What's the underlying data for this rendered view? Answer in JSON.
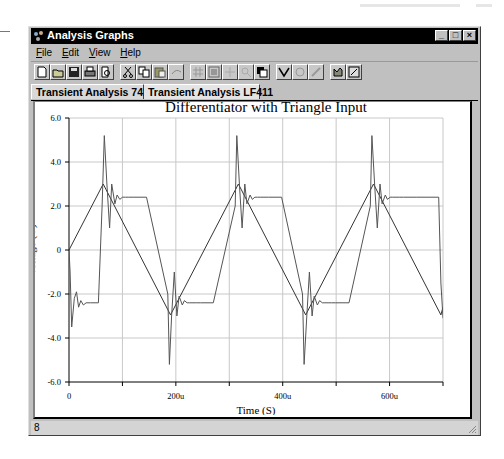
{
  "window": {
    "title": "Analysis Graphs",
    "controls": {
      "minimize": "_",
      "maximize": "□",
      "close": "×"
    }
  },
  "menu": {
    "items": [
      "File",
      "Edit",
      "View",
      "Help"
    ]
  },
  "toolbar": {
    "buttons": [
      "new-icon",
      "open-icon",
      "save-icon",
      "print-icon",
      "print-preview-icon",
      "cut-icon",
      "copy-icon",
      "paste-icon",
      "undo-icon",
      "grid-icon",
      "list-icon",
      "cursor-icon",
      "zoom-icon",
      "overlay-icon",
      "trace-icon",
      "properties-icon",
      "marker-icon",
      "export-icon",
      "toggle-icon"
    ]
  },
  "tabs": [
    {
      "label": "Transient Analysis 741",
      "active": true
    },
    {
      "label": "Transient Analysis LF411",
      "active": false
    }
  ],
  "statusbar": {
    "text": "8"
  },
  "chart_data": {
    "type": "line",
    "title": "Differentiator with Triangle Input",
    "xlabel": "Time (S)",
    "ylabel": "Voltage (V)",
    "xlim": [
      0,
      700
    ],
    "ylim": [
      -6.0,
      6.0
    ],
    "x_unit": "u",
    "x_ticks": [
      0,
      100,
      200,
      300,
      400,
      500,
      600,
      700
    ],
    "x_tick_labels": [
      "0",
      "",
      "200u",
      "",
      "400u",
      "",
      "600u",
      ""
    ],
    "y_ticks": [
      6.0,
      4.0,
      2.0,
      0,
      -2.0,
      -4.0,
      -6.0
    ],
    "y_tick_labels": [
      "6.0",
      "4.0",
      "2.0",
      "0",
      "-2.0",
      "-4.0",
      "-6.0"
    ],
    "grid": true,
    "legend": null,
    "series": [
      {
        "name": "Triangle input",
        "x": [
          0,
          64,
          190,
          317,
          443,
          570,
          696,
          700
        ],
        "y": [
          0,
          3.0,
          -2.95,
          3.0,
          -2.95,
          3.0,
          -2.95,
          -2.6
        ]
      },
      {
        "name": "Differentiator output",
        "x": [
          0,
          2,
          5,
          10,
          14,
          18,
          22,
          27,
          32,
          40,
          55,
          62,
          66,
          71,
          76,
          80,
          86,
          90,
          95,
          100,
          106,
          112,
          120,
          145,
          185,
          188,
          192,
          197,
          202,
          206,
          212,
          216,
          221,
          226,
          232,
          238,
          246,
          270,
          311,
          314,
          319,
          324,
          329,
          333,
          339,
          343,
          348,
          353,
          359,
          365,
          373,
          398,
          437,
          440,
          445,
          450,
          455,
          459,
          465,
          469,
          474,
          479,
          485,
          491,
          499,
          524,
          564,
          567,
          572,
          577,
          582,
          586,
          592,
          596,
          601,
          606,
          612,
          618,
          626,
          651,
          692,
          696,
          700
        ],
        "y": [
          0,
          -1.0,
          -3.5,
          -2.2,
          -1.9,
          -2.6,
          -2.3,
          -2.5,
          -2.4,
          -2.4,
          -2.4,
          2.0,
          5.2,
          3.0,
          1.0,
          3.0,
          2.1,
          2.5,
          2.3,
          2.4,
          2.4,
          2.4,
          2.4,
          2.4,
          -2.0,
          -5.2,
          -3.0,
          -1.0,
          -3.0,
          -2.1,
          -2.5,
          -2.3,
          -2.4,
          -2.4,
          -2.4,
          -2.4,
          -2.4,
          -2.4,
          2.0,
          5.2,
          3.0,
          1.0,
          3.0,
          2.1,
          2.5,
          2.3,
          2.4,
          2.4,
          2.4,
          2.4,
          2.4,
          2.4,
          -2.0,
          -5.2,
          -3.0,
          -1.0,
          -3.0,
          -2.1,
          -2.5,
          -2.3,
          -2.4,
          -2.4,
          -2.4,
          -2.4,
          -2.4,
          -2.4,
          2.0,
          5.2,
          3.0,
          1.0,
          3.0,
          2.1,
          2.5,
          2.3,
          2.4,
          2.4,
          2.4,
          2.4,
          2.4,
          2.4,
          2.4,
          -1.5,
          -3.1
        ]
      }
    ],
    "colors": {
      "grid": "#c8c8c8",
      "axis": "#000000",
      "trace": "#404040"
    }
  }
}
